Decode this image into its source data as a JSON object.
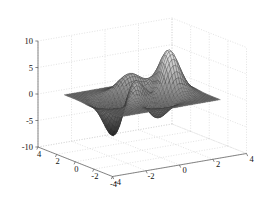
{
  "figure": {
    "title": "",
    "background_color": "#ffffff",
    "axis_color": "#555555",
    "grid_color": "#c9c9c9",
    "label_color": "#111111"
  },
  "chart_data": {
    "type": "surface",
    "title": "",
    "xlabel": "",
    "ylabel": "",
    "zlabel": "",
    "function": "peaks",
    "formula": "z = 3*(1-x)^2*exp(-x^2-(y+1)^2) - 10*(x/5 - x^3 - y^5)*exp(-x^2-y^2) - 1/3*exp(-(x+1)^2 - y^2)",
    "colormap": "gray",
    "shading": "faceted",
    "mesh": true,
    "grid": true,
    "view": {
      "azimuth": -37.5,
      "elevation": 30
    },
    "xlim": [
      -4,
      4
    ],
    "ylim": [
      -4,
      4
    ],
    "zlim": [
      -10,
      10
    ],
    "xticks": [
      -4,
      -2,
      0,
      2,
      4
    ],
    "yticks": [
      -4,
      -2,
      0,
      2,
      4
    ],
    "zticks": [
      -10,
      -5,
      0,
      5,
      10
    ],
    "xticklabels": [
      "-4",
      "-2",
      "0",
      "2",
      "4"
    ],
    "yticklabels": [
      "4",
      "2",
      "0",
      "-2",
      "-4"
    ],
    "zticklabels": [
      "10",
      "5",
      "0",
      "-5",
      "-10"
    ],
    "grid_resolution": 41,
    "surface_domain": [
      -3,
      3
    ],
    "extrema": {
      "max_value": 8.1,
      "max_at": [
        -0.01,
        1.58
      ],
      "min_value": -6.55,
      "min_at": [
        0.23,
        -1.63
      ]
    }
  },
  "axes": {
    "z": {
      "name": "z-axis",
      "ticks": [
        {
          "value": 10,
          "label": "10"
        },
        {
          "value": 5,
          "label": "5"
        },
        {
          "value": 0,
          "label": "0"
        },
        {
          "value": -5,
          "label": "-5"
        },
        {
          "value": -10,
          "label": "-10"
        }
      ]
    },
    "x_front_left": {
      "name": "left-front-axis",
      "ticks": [
        {
          "value": 4,
          "label": "4"
        },
        {
          "value": 2,
          "label": "2"
        },
        {
          "value": 0,
          "label": "0"
        },
        {
          "value": -2,
          "label": "-2"
        },
        {
          "value": -4,
          "label": "-4"
        }
      ]
    },
    "y_front_right": {
      "name": "right-front-axis",
      "ticks": [
        {
          "value": -4,
          "label": "-4"
        },
        {
          "value": -2,
          "label": "-2"
        },
        {
          "value": 0,
          "label": "0"
        },
        {
          "value": 2,
          "label": "2"
        },
        {
          "value": 4,
          "label": "4"
        }
      ]
    }
  }
}
